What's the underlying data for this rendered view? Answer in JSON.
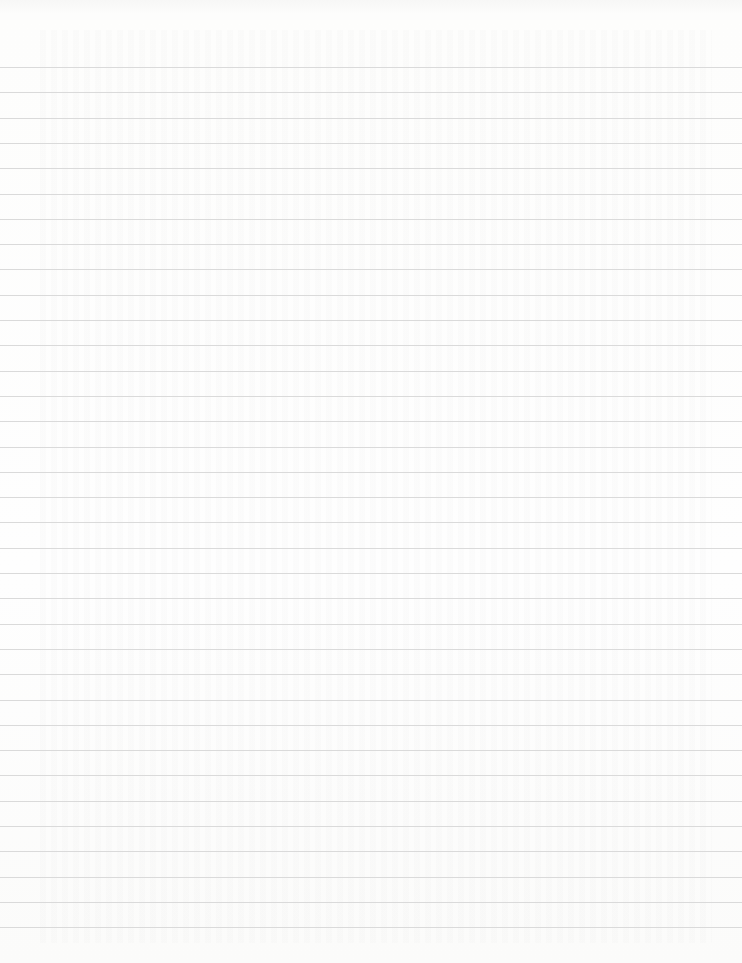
{
  "sheet": {
    "type": "ruled notebook paper",
    "background_color": "#fdfdfc",
    "rule_color": "#d6d6d6",
    "text": "",
    "rule_count": 35,
    "first_rule_y": 67,
    "rule_spacing_px": 25.3
  }
}
